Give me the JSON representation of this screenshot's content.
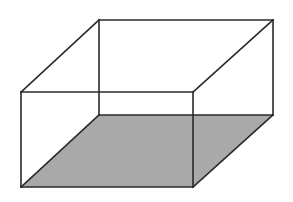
{
  "figure": {
    "type": "cuboid-wireframe",
    "width": 293,
    "height": 202,
    "colors": {
      "stroke": "#2a2a2a",
      "bottom_face_fill": "#a9a9a9",
      "background": "#ffffff"
    },
    "vertices": {
      "front_top_left": [
        21,
        92
      ],
      "front_top_right": [
        193,
        92
      ],
      "front_bottom_left": [
        21,
        187
      ],
      "front_bottom_right": [
        193,
        187
      ],
      "back_top_left": [
        99,
        20
      ],
      "back_top_right": [
        273,
        20
      ],
      "back_bottom_left": [
        99,
        115
      ],
      "back_bottom_right": [
        273,
        115
      ]
    },
    "shaded_face": "bottom"
  }
}
